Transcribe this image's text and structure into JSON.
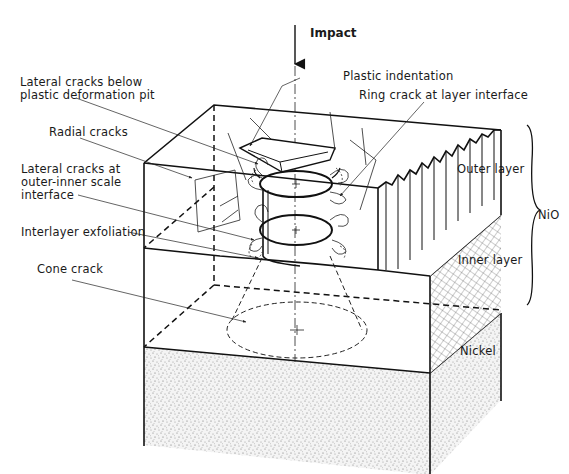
{
  "diagram": {
    "impact_label": "Impact",
    "labels": {
      "lateral_cracks_below_line1": "Lateral cracks below",
      "lateral_cracks_below_line2": "plastic deformation pit",
      "plastic_indentation": "Plastic indentation",
      "ring_crack": "Ring crack at layer interface",
      "radial_cracks": "Radial cracks",
      "lateral_cracks_at_line1": "Lateral cracks at",
      "lateral_cracks_at_line2": "outer-inner scale",
      "lateral_cracks_at_line3": "interface",
      "interlayer_exfoliation": "Interlayer exfoliation",
      "cone_crack": "Cone crack",
      "outer_layer": "Outer layer",
      "inner_layer": "Inner layer",
      "nio": "NiO",
      "nickel": "Nickel"
    },
    "colors": {
      "ink": "#111111",
      "paper": "#ffffff",
      "stipple": "#8a8a8a"
    }
  }
}
